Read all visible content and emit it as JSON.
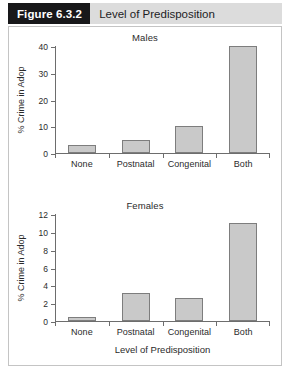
{
  "header": {
    "tag": "Figure 6.3.2",
    "caption": "Level of Predisposition"
  },
  "chart_data": [
    {
      "type": "bar",
      "title": "Males",
      "categories": [
        "None",
        "Postnatal",
        "Congenital",
        "Both"
      ],
      "values": [
        3,
        5,
        10,
        40
      ],
      "xlabel": "",
      "ylabel": "% Crime in Adop",
      "ylim": [
        0,
        40
      ],
      "yticks": [
        0,
        10,
        20,
        30,
        40
      ],
      "ytick_labels": [
        "0",
        "10",
        "20",
        "30",
        "40"
      ],
      "grid": false,
      "legend": "none",
      "bar_color": "#c9c9c9",
      "bar_border_color": "#7d7d7d"
    },
    {
      "type": "bar",
      "title": "Females",
      "categories": [
        "None",
        "Postnatal",
        "Congenital",
        "Both"
      ],
      "values": [
        0.4,
        3.1,
        2.55,
        11
      ],
      "xlabel": "Level of Predisposition",
      "ylabel": "% Crime in Adop",
      "ylim": [
        0,
        12
      ],
      "yticks": [
        0,
        2,
        4,
        6,
        8,
        10,
        12
      ],
      "ytick_labels": [
        "0",
        "2",
        "4",
        "6",
        "8",
        "10",
        "12"
      ],
      "grid": false,
      "legend": "none",
      "bar_color": "#c9c9c9",
      "bar_border_color": "#7d7d7d"
    }
  ]
}
